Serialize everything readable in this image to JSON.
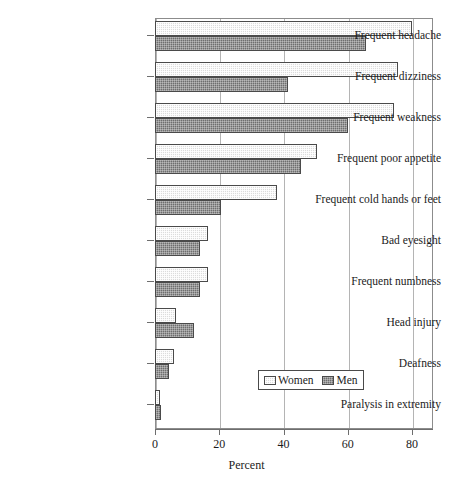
{
  "chart_data": {
    "type": "bar",
    "orientation": "horizontal",
    "title": "",
    "xlabel": "Percent",
    "ylabel": "",
    "xlim": [
      0,
      86.5
    ],
    "xticks": [
      0,
      20,
      40,
      60,
      80
    ],
    "xticklabels": [
      "0",
      "20",
      "40",
      "60",
      "80"
    ],
    "grid": "vertical",
    "legend_position": "lower right",
    "categories": [
      "Frequent headache",
      "Frequent dizziness",
      "Frequent weakness",
      "Frequent poor appetite",
      "Frequent cold hands or feet",
      "Bad eyesight",
      "Frequent numbness",
      "Head injury",
      "Deafness",
      "Paralysis in extremity"
    ],
    "series": [
      {
        "name": "Women",
        "color": "#dcdcdc",
        "values": [
          80,
          75.5,
          74.5,
          50.5,
          38,
          16.5,
          16.5,
          6.5,
          6,
          1.5
        ]
      },
      {
        "name": "Men",
        "color": "#6e6e6e",
        "values": [
          65.5,
          41.5,
          60,
          45.5,
          20.5,
          14,
          14,
          12,
          4.5,
          2
        ]
      }
    ]
  },
  "legend": {
    "entries": [
      {
        "label": "Women",
        "swatch": "women-swatch-icon"
      },
      {
        "label": "Men",
        "swatch": "men-swatch-icon"
      }
    ]
  },
  "axis": {
    "x_title": "Percent"
  }
}
